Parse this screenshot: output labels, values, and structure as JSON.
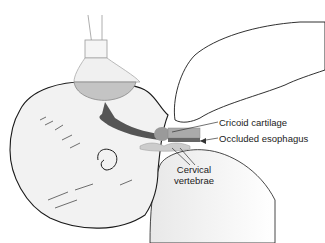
{
  "figure": {
    "labels": {
      "cricoid": "Cricoid cartilage",
      "esophagus": "Occluded esophagus",
      "cervical_line1": "Cervical",
      "cervical_line2": "vertebrae"
    },
    "colors": {
      "outline": "#1a1a1a",
      "skin_fill": "#f0f0f0",
      "mask": "#c4c4c4",
      "airway": "#555555",
      "cartilage": "#9a9a9a",
      "text": "#222222"
    }
  }
}
